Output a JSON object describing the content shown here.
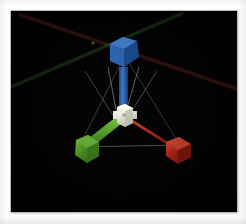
{
  "app": {
    "title": "3D Viewport",
    "viewport_label": "perspective-viewport"
  },
  "viewport": {
    "background_color": "#000000",
    "frame_color": "#fdfdfd",
    "border_color": "#b9b9b9",
    "x": 11,
    "y": 11,
    "width": 226,
    "height": 201
  },
  "gizmo": {
    "type": "translate-gizmo",
    "center": {
      "x": 120,
      "y": 113
    },
    "hub": {
      "label": "center-handle",
      "color": "#f2f2ec",
      "shade_color": "#c9c9bd",
      "highlight_color": "#fffbe0",
      "size": 19
    },
    "axes": [
      {
        "id": "z",
        "label": "blue-axis-handle",
        "color": "#2a66b8",
        "shaft_color": "#2f6fc4",
        "dark_color": "#15407c",
        "light_color": "#4a8ade",
        "tip": {
          "x": 124,
          "y": 53
        },
        "handle_size": 23
      },
      {
        "id": "x",
        "label": "green-axis-handle",
        "color": "#4f9b22",
        "shaft_color": "#58a827",
        "dark_color": "#2e6312",
        "light_color": "#7dc94a",
        "tip": {
          "x": 76,
          "y": 152
        },
        "handle_size": 23
      },
      {
        "id": "y",
        "label": "red-axis-handle",
        "color": "#b02216",
        "shaft_color": "#c3291a",
        "dark_color": "#6d1109",
        "light_color": "#e2513c",
        "tip": {
          "x": 178,
          "y": 150
        },
        "handle_size": 23
      }
    ],
    "wireframe": {
      "label": "plane-wireframe",
      "color": "#8c8c7a",
      "opacity": 0.55
    },
    "fan_lines": {
      "label": "gizmo-fan-lines",
      "color": "#c8c8c0",
      "opacity": 0.65
    }
  },
  "grid": {
    "label": "world-axis-lines",
    "lines": [
      {
        "id": "world-axis-red",
        "color": "#7a2a22",
        "from": {
          "x": 18,
          "y": 14
        },
        "to": {
          "x": 234,
          "y": 88
        }
      },
      {
        "id": "world-axis-green",
        "color": "#2f5f22",
        "from": {
          "x": 13,
          "y": 86
        },
        "to": {
          "x": 182,
          "y": 13
        }
      }
    ],
    "crossing_point": {
      "x": 93,
      "y": 43
    }
  }
}
